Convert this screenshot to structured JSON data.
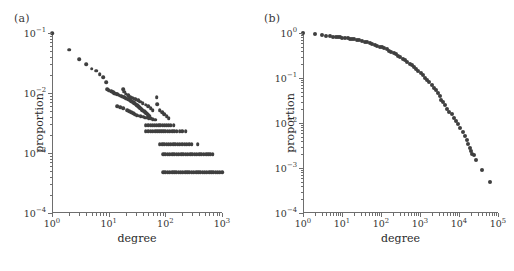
{
  "figure": {
    "panels": [
      {
        "label": "(a)",
        "xlabel": "degree",
        "ylabel": "proportion",
        "xticks": [
          "10^0",
          "10^1",
          "10^2",
          "10^3"
        ],
        "yticks": [
          "10^-1",
          "10^-2",
          "10^-3",
          "10^-4"
        ]
      },
      {
        "label": "(b)",
        "xlabel": "degree",
        "ylabel": "proportion",
        "xticks": [
          "10^0",
          "10^1",
          "10^2",
          "10^3",
          "10^4",
          "10^5"
        ],
        "yticks": [
          "10^0",
          "10^-1",
          "10^-2",
          "10^-3",
          "10^-4"
        ]
      }
    ],
    "marker_color": "#3f3f3f",
    "axis_color": "#6e6e6e",
    "background_color": "#ffffff"
  },
  "chart_data": [
    {
      "type": "scatter",
      "title": "(a)",
      "xlabel": "degree",
      "ylabel": "proportion",
      "xscale": "log",
      "yscale": "log",
      "xlim": [
        1,
        1000
      ],
      "ylim": [
        0.0001,
        0.1
      ],
      "grid": false,
      "legend": null,
      "description": "Degree distribution (pdf) on log-log axes: power-law decay with discrete horizontal bands at small proportions.",
      "points": [
        [
          1,
          0.1
        ],
        [
          2,
          0.053
        ],
        [
          3,
          0.037
        ],
        [
          4,
          0.03
        ],
        [
          5,
          0.0255
        ],
        [
          6,
          0.0235
        ],
        [
          7,
          0.0205
        ],
        [
          8,
          0.0185
        ],
        [
          9,
          0.015
        ],
        [
          9.5,
          0.0115
        ],
        [
          10,
          0.0112
        ],
        [
          11,
          0.0108
        ],
        [
          11.5,
          0.0105
        ],
        [
          12,
          0.0102
        ],
        [
          12.5,
          0.01
        ],
        [
          13,
          0.0098
        ],
        [
          13.5,
          0.0097
        ],
        [
          14,
          0.0095
        ],
        [
          15,
          0.0093
        ],
        [
          16,
          0.009
        ],
        [
          17,
          0.0088
        ],
        [
          18,
          0.0087
        ],
        [
          19,
          0.0085
        ],
        [
          20,
          0.0082
        ],
        [
          21,
          0.008
        ],
        [
          22,
          0.0078
        ],
        [
          23,
          0.0077
        ],
        [
          24,
          0.0075
        ],
        [
          25,
          0.0073
        ],
        [
          26,
          0.0072
        ],
        [
          27,
          0.007
        ],
        [
          28,
          0.0068
        ],
        [
          29,
          0.0067
        ],
        [
          30,
          0.0065
        ],
        [
          31,
          0.0063
        ],
        [
          32,
          0.0062
        ],
        [
          33,
          0.006
        ],
        [
          34,
          0.0059
        ],
        [
          35,
          0.0058
        ],
        [
          36,
          0.0056
        ],
        [
          37,
          0.0055
        ],
        [
          38,
          0.0054
        ],
        [
          39,
          0.0052
        ],
        [
          40,
          0.0051
        ],
        [
          42,
          0.005
        ],
        [
          44,
          0.0048
        ],
        [
          46,
          0.0046
        ],
        [
          48,
          0.0045
        ],
        [
          50,
          0.0043
        ],
        [
          52,
          0.0042
        ],
        [
          18,
          0.0115
        ],
        [
          19,
          0.0105
        ],
        [
          20,
          0.0098
        ],
        [
          22,
          0.0092
        ],
        [
          24,
          0.0086
        ],
        [
          26,
          0.0084
        ],
        [
          28,
          0.008
        ],
        [
          30,
          0.0078
        ],
        [
          33,
          0.0076
        ],
        [
          36,
          0.0072
        ],
        [
          40,
          0.0068
        ],
        [
          45,
          0.0064
        ],
        [
          50,
          0.006
        ],
        [
          55,
          0.0056
        ],
        [
          60,
          0.0052
        ],
        [
          14,
          0.006
        ],
        [
          16,
          0.0058
        ],
        [
          18,
          0.0056
        ],
        [
          21,
          0.0052
        ],
        [
          23,
          0.005
        ],
        [
          25,
          0.0048
        ],
        [
          27,
          0.0046
        ],
        [
          29,
          0.0044
        ],
        [
          31,
          0.0043
        ],
        [
          34,
          0.0042
        ],
        [
          37,
          0.0041
        ],
        [
          41,
          0.004
        ],
        [
          44,
          0.0039
        ],
        [
          47,
          0.0039
        ],
        [
          51,
          0.0038
        ],
        [
          55,
          0.0038
        ],
        [
          60,
          0.0037
        ],
        [
          66,
          0.0036
        ],
        [
          70,
          0.0085
        ],
        [
          72,
          0.0065
        ],
        [
          80,
          0.0052
        ],
        [
          88,
          0.0048
        ],
        [
          95,
          0.0044
        ],
        [
          105,
          0.0041
        ],
        [
          115,
          0.0038
        ],
        [
          45,
          0.0029
        ],
        [
          50,
          0.0029
        ],
        [
          55,
          0.0029
        ],
        [
          60,
          0.0029
        ],
        [
          65,
          0.0029
        ],
        [
          70,
          0.0029
        ],
        [
          76,
          0.0029
        ],
        [
          82,
          0.0029
        ],
        [
          90,
          0.0029
        ],
        [
          97,
          0.0029
        ],
        [
          105,
          0.0029
        ],
        [
          115,
          0.0029
        ],
        [
          125,
          0.0029
        ],
        [
          140,
          0.0029
        ],
        [
          45,
          0.0023
        ],
        [
          50,
          0.0023
        ],
        [
          55,
          0.0023
        ],
        [
          60,
          0.0023
        ],
        [
          66,
          0.0023
        ],
        [
          72,
          0.0023
        ],
        [
          78,
          0.0023
        ],
        [
          85,
          0.0023
        ],
        [
          92,
          0.0023
        ],
        [
          100,
          0.0023
        ],
        [
          110,
          0.0023
        ],
        [
          120,
          0.0023
        ],
        [
          132,
          0.0023
        ],
        [
          145,
          0.0023
        ],
        [
          160,
          0.0023
        ],
        [
          178,
          0.0023
        ],
        [
          200,
          0.0023
        ],
        [
          230,
          0.0023
        ],
        [
          80,
          0.0014
        ],
        [
          88,
          0.0014
        ],
        [
          96,
          0.0014
        ],
        [
          105,
          0.0014
        ],
        [
          115,
          0.0014
        ],
        [
          125,
          0.0014
        ],
        [
          137,
          0.0014
        ],
        [
          150,
          0.0014
        ],
        [
          165,
          0.0014
        ],
        [
          180,
          0.0014
        ],
        [
          198,
          0.0014
        ],
        [
          218,
          0.0014
        ],
        [
          240,
          0.0014
        ],
        [
          265,
          0.0014
        ],
        [
          290,
          0.0014
        ],
        [
          370,
          0.0014
        ],
        [
          92,
          0.00095
        ],
        [
          100,
          0.00095
        ],
        [
          110,
          0.00095
        ],
        [
          120,
          0.00095
        ],
        [
          132,
          0.00095
        ],
        [
          145,
          0.00095
        ],
        [
          158,
          0.00095
        ],
        [
          173,
          0.00095
        ],
        [
          190,
          0.00095
        ],
        [
          208,
          0.00095
        ],
        [
          228,
          0.00095
        ],
        [
          250,
          0.00095
        ],
        [
          274,
          0.00095
        ],
        [
          300,
          0.00095
        ],
        [
          330,
          0.00095
        ],
        [
          360,
          0.00095
        ],
        [
          395,
          0.00095
        ],
        [
          433,
          0.00095
        ],
        [
          475,
          0.00095
        ],
        [
          520,
          0.00095
        ],
        [
          570,
          0.00095
        ],
        [
          625,
          0.00095
        ],
        [
          685,
          0.00095
        ],
        [
          92,
          0.00048
        ],
        [
          100,
          0.00048
        ],
        [
          110,
          0.00048
        ],
        [
          120,
          0.00048
        ],
        [
          131,
          0.00048
        ],
        [
          143,
          0.00048
        ],
        [
          157,
          0.00048
        ],
        [
          171,
          0.00048
        ],
        [
          187,
          0.00048
        ],
        [
          204,
          0.00048
        ],
        [
          223,
          0.00048
        ],
        [
          244,
          0.00048
        ],
        [
          266,
          0.00048
        ],
        [
          291,
          0.00048
        ],
        [
          318,
          0.00048
        ],
        [
          347,
          0.00048
        ],
        [
          379,
          0.00048
        ],
        [
          414,
          0.00048
        ],
        [
          453,
          0.00048
        ],
        [
          495,
          0.00048
        ],
        [
          540,
          0.00048
        ],
        [
          590,
          0.00048
        ],
        [
          645,
          0.00048
        ],
        [
          705,
          0.00048
        ],
        [
          770,
          0.00048
        ],
        [
          840,
          0.00048
        ],
        [
          918,
          0.00048
        ],
        [
          1000,
          0.00048
        ]
      ]
    },
    {
      "type": "scatter",
      "title": "(b)",
      "xlabel": "degree",
      "ylabel": "proportion",
      "xscale": "log",
      "yscale": "log",
      "xlim": [
        1,
        100000
      ],
      "ylim": [
        0.0001,
        1
      ],
      "grid": false,
      "legend": null,
      "description": "Complementary cumulative degree distribution (CCDF) on log-log axes: flat near 1 for small degree, convex decay, sparse tail to ~5e-4 near degree 6e4.",
      "points": [
        [
          1,
          1.0
        ],
        [
          2,
          0.93
        ],
        [
          3,
          0.88
        ],
        [
          4,
          0.855
        ],
        [
          5,
          0.84
        ],
        [
          6,
          0.83
        ],
        [
          7,
          0.82
        ],
        [
          8,
          0.81
        ],
        [
          9,
          0.8
        ],
        [
          10,
          0.79
        ],
        [
          12,
          0.775
        ],
        [
          14,
          0.765
        ],
        [
          16,
          0.75
        ],
        [
          18,
          0.74
        ],
        [
          20,
          0.73
        ],
        [
          24,
          0.71
        ],
        [
          28,
          0.69
        ],
        [
          32,
          0.67
        ],
        [
          38,
          0.645
        ],
        [
          45,
          0.62
        ],
        [
          52,
          0.6
        ],
        [
          60,
          0.575
        ],
        [
          70,
          0.55
        ],
        [
          80,
          0.525
        ],
        [
          92,
          0.5
        ],
        [
          105,
          0.478
        ],
        [
          120,
          0.455
        ],
        [
          140,
          0.43
        ],
        [
          160,
          0.405
        ],
        [
          185,
          0.38
        ],
        [
          210,
          0.36
        ],
        [
          240,
          0.335
        ],
        [
          275,
          0.31
        ],
        [
          315,
          0.29
        ],
        [
          360,
          0.27
        ],
        [
          410,
          0.25
        ],
        [
          470,
          0.228
        ],
        [
          540,
          0.208
        ],
        [
          615,
          0.19
        ],
        [
          700,
          0.173
        ],
        [
          800,
          0.157
        ],
        [
          910,
          0.142
        ],
        [
          1040,
          0.128
        ],
        [
          1180,
          0.115
        ],
        [
          1350,
          0.102
        ],
        [
          1540,
          0.091
        ],
        [
          1750,
          0.08
        ],
        [
          2000,
          0.07
        ],
        [
          2280,
          0.061
        ],
        [
          2600,
          0.053
        ],
        [
          2950,
          0.046
        ],
        [
          3200,
          0.04
        ],
        [
          3500,
          0.033
        ],
        [
          3900,
          0.029
        ],
        [
          4400,
          0.025
        ],
        [
          5000,
          0.021
        ],
        [
          5700,
          0.018
        ],
        [
          6500,
          0.0155
        ],
        [
          7400,
          0.0132
        ],
        [
          8400,
          0.0112
        ],
        [
          9600,
          0.0094
        ],
        [
          10900,
          0.0078
        ],
        [
          12400,
          0.0064
        ],
        [
          14000,
          0.0052
        ],
        [
          15800,
          0.0042
        ],
        [
          17500,
          0.0034
        ],
        [
          19000,
          0.0028
        ],
        [
          20500,
          0.0024
        ],
        [
          22000,
          0.0021
        ],
        [
          24000,
          0.0019
        ],
        [
          27000,
          0.0015
        ],
        [
          38000,
          0.00092
        ],
        [
          62000,
          0.00048
        ]
      ]
    }
  ]
}
